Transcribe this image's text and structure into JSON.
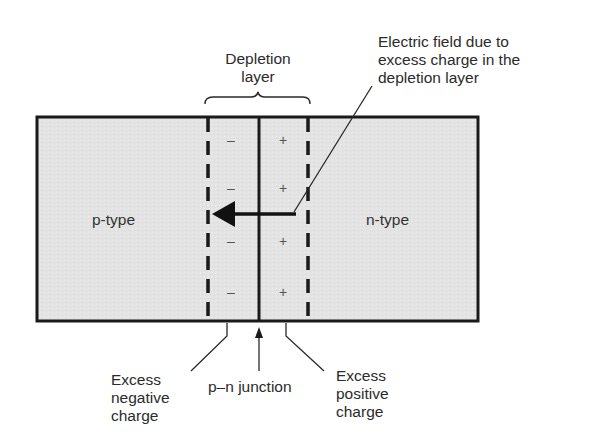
{
  "diagram": {
    "type": "pn-junction-depletion-layer",
    "regions": {
      "p_type": {
        "label": "p-type"
      },
      "n_type": {
        "label": "n-type"
      }
    },
    "depletion_layer": {
      "label_line1": "Depletion",
      "label_line2": "layer"
    },
    "electric_field": {
      "label_line1": "Electric field due to",
      "label_line2": "excess charge in the",
      "label_line3": "depletion layer",
      "direction": "n-to-p (right to left)"
    },
    "charges": {
      "negative_symbol": "–",
      "positive_symbol": "+",
      "negative_count": 4,
      "positive_count": 4
    },
    "bottom_labels": {
      "excess_negative": {
        "line1": "Excess",
        "line2": "negative",
        "line3": "charge"
      },
      "junction": {
        "line1": "p–n junction"
      },
      "excess_positive": {
        "line1": "Excess",
        "line2": "positive",
        "line3": "charge"
      }
    },
    "colors": {
      "region_fill": "#e4e4e4",
      "stroke": "#1a1a1a",
      "text": "#2b2b2b",
      "background": "#ffffff"
    }
  }
}
